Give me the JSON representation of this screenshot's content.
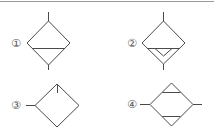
{
  "diagram": {
    "title": "",
    "stroke_color": "#4a4a4a",
    "label_color": "#555555",
    "symbols": [
      {
        "id": 1,
        "label": "①",
        "description": "diamond with horizontal line near lower half, vertical in/out leads"
      },
      {
        "id": 2,
        "label": "②",
        "description": "diamond with horizontal line and inner down-pointing triangle, vertical leads"
      },
      {
        "id": 3,
        "label": "③",
        "description": "diamond with left lead and small tick at top vertex"
      },
      {
        "id": 4,
        "label": "④",
        "description": "diamond with left/right leads, top and bottom small triangles"
      }
    ]
  }
}
